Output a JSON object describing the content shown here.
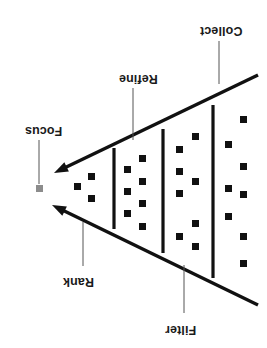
{
  "diagram": {
    "name": "inverted-funnel-process-diagram",
    "orientation": "rotated-180",
    "colors": {
      "stroke": "#111111",
      "square_fill": "#111111",
      "focus_square_fill": "#8c8c8c",
      "leader_line": "#555555",
      "background": "#ffffff"
    },
    "labels": [
      {
        "id": "collect",
        "text": "Collect",
        "x": 200,
        "y": 24
      },
      {
        "id": "refine",
        "text": "Refine",
        "x": 119,
        "y": 72
      },
      {
        "id": "focus",
        "text": "Focus",
        "x": 25,
        "y": 124
      },
      {
        "id": "rank",
        "text": "Rank",
        "x": 63,
        "y": 275
      },
      {
        "id": "filter",
        "text": "Filter",
        "x": 165,
        "y": 323
      }
    ],
    "leaders": [
      {
        "id": "collect-leader",
        "x1": 219,
        "y1": 41,
        "x2": 219,
        "y2": 84
      },
      {
        "id": "refine-leader",
        "x1": 133,
        "y1": 88,
        "x2": 133,
        "y2": 140
      },
      {
        "id": "focus-leader",
        "x1": 39,
        "y1": 140,
        "x2": 39,
        "y2": 184
      },
      {
        "id": "rank-leader",
        "x1": 83,
        "y1": 266,
        "x2": 83,
        "y2": 222
      },
      {
        "id": "filter-leader",
        "x1": 184,
        "y1": 313,
        "x2": 184,
        "y2": 265
      }
    ],
    "funnel_edges": [
      {
        "id": "upper-edge",
        "x1": 258,
        "y1": 75,
        "x2": 54,
        "y2": 173,
        "arrow": "end"
      },
      {
        "id": "lower-edge",
        "x1": 258,
        "y1": 305,
        "x2": 52,
        "y2": 205,
        "arrow": "end"
      }
    ],
    "dividers": [
      {
        "id": "divider-1",
        "x": 114,
        "y1": 148,
        "y2": 229
      },
      {
        "id": "divider-2",
        "x": 163,
        "y1": 129,
        "y2": 253
      },
      {
        "id": "divider-3",
        "x": 213,
        "y1": 105,
        "y2": 278
      }
    ],
    "focus_square": {
      "id": "focus-output-square",
      "x": 36,
      "y": 185,
      "size": 7
    },
    "stage_squares": [
      {
        "stage": "focus-stage",
        "count": 3,
        "points": [
          [
            74,
            183
          ],
          [
            88,
            173
          ],
          [
            88,
            195
          ]
        ]
      },
      {
        "stage": "rank-stage",
        "count": 7,
        "points": [
          [
            124,
            166
          ],
          [
            124,
            188
          ],
          [
            124,
            210
          ],
          [
            139,
            155
          ],
          [
            139,
            178
          ],
          [
            139,
            200
          ],
          [
            139,
            223
          ]
        ]
      },
      {
        "stage": "refine-stage",
        "count": 8,
        "points": [
          [
            176,
            146
          ],
          [
            176,
            168
          ],
          [
            176,
            190
          ],
          [
            176,
            233
          ],
          [
            192,
            133
          ],
          [
            192,
            178
          ],
          [
            192,
            220
          ],
          [
            192,
            243
          ]
        ]
      },
      {
        "stage": "collect-stage",
        "count": 8,
        "points": [
          [
            225,
            141
          ],
          [
            225,
            185
          ],
          [
            225,
            213
          ],
          [
            240,
            116
          ],
          [
            240,
            163
          ],
          [
            240,
            191
          ],
          [
            240,
            233
          ],
          [
            240,
            260
          ]
        ]
      }
    ],
    "square_size": 7
  }
}
